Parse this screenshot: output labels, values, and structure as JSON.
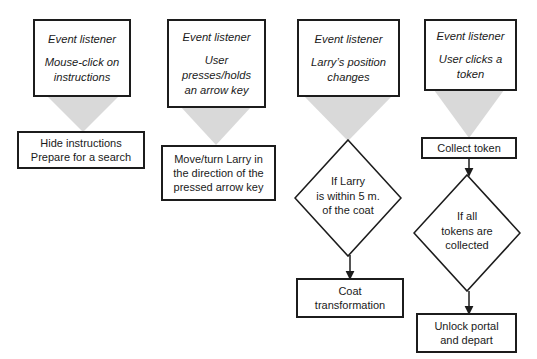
{
  "diagram": {
    "colors": {
      "stroke": "#1c1c1c",
      "wedge_fill": "#d9d9d9",
      "background": "#ffffff",
      "text": "#1a1a1a"
    },
    "columns": [
      {
        "id": "column-mouse-click",
        "listener": {
          "heading": "Event listener",
          "line1": "Mouse-click on",
          "line2": "instructions"
        },
        "action": {
          "line1": "Hide instructions",
          "line2": "Prepare for a search"
        }
      },
      {
        "id": "column-arrow-key",
        "listener": {
          "heading": "Event listener",
          "line1": "User",
          "line2": "presses/holds",
          "line3": "an arrow key"
        },
        "action": {
          "line1": "Move/turn  Larry in",
          "line2": "the direction of the",
          "line3": "pressed arrow key"
        }
      },
      {
        "id": "column-position-change",
        "listener": {
          "heading": "Event listener",
          "line1": "Larry’s position",
          "line2": "changes"
        },
        "decision": {
          "line1": "If Larry",
          "line2": "is within 5 m.",
          "line3": "of the coat"
        },
        "result": {
          "line1": "Coat",
          "line2": "transformation"
        }
      },
      {
        "id": "column-token-click",
        "listener": {
          "heading": "Event listener",
          "line1": "User clicks a",
          "line2": "token"
        },
        "action": {
          "line1": "Collect token"
        },
        "decision": {
          "line1": "If all",
          "line2": "tokens are",
          "line3": "collected"
        },
        "result": {
          "line1": "Unlock portal",
          "line2": "and depart"
        }
      }
    ]
  }
}
